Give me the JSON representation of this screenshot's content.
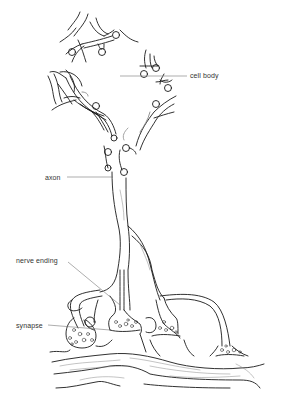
{
  "diagram": {
    "labels": {
      "cell_body": "cell body",
      "axon": "axon",
      "nerve_ending": "nerve ending",
      "synapse": "synapse"
    },
    "colors": {
      "stroke": "#1a1a1a",
      "leader": "#777777",
      "background": "#ffffff",
      "label_text": "#333333"
    }
  }
}
